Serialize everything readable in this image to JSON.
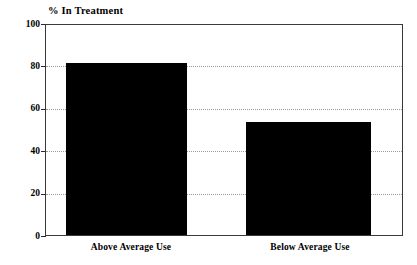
{
  "chart_data": {
    "type": "bar",
    "title": "% In Treatment",
    "xlabel": "",
    "ylabel": "% In Treatment",
    "categories": [
      "Above Average Use",
      "Below Average Use"
    ],
    "values": [
      82,
      54
    ],
    "ylim": [
      0,
      100
    ],
    "yticks": [
      0,
      20,
      40,
      60,
      80,
      100
    ],
    "ytick_labels": [
      "0",
      "20",
      "40",
      "60",
      "80",
      "100"
    ],
    "grid": true,
    "grid_axis": "y",
    "legend": false,
    "legend_position": "none",
    "bar_color": "#000000",
    "frame_color": "#3a3a3a",
    "gridline_color": "#9a9a9a",
    "series": [
      {
        "name": "% In Treatment",
        "values": [
          82,
          54
        ]
      }
    ]
  }
}
